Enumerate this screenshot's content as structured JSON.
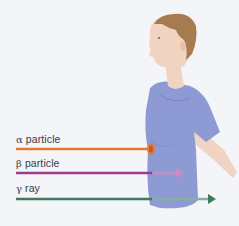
{
  "figure": {
    "title": ""
  },
  "beams": [
    {
      "symbol": "α",
      "name": "particle",
      "color": "#e8772f",
      "outcome": "stopped-at-skin"
    },
    {
      "symbol": "β",
      "name": "particle",
      "color": "#9b3d8c",
      "exit_color": "#c98dc4",
      "outcome": "penetrates-partially"
    },
    {
      "symbol": "γ",
      "name": "ray",
      "color": "#3f7a5c",
      "exit_color": "#86b09a",
      "outcome": "passes-through"
    }
  ],
  "colors": {
    "background": "#f4f5f9",
    "shirt": "#8e9ad4",
    "skin": "#f1d3c2",
    "hair": "#a67b4f"
  }
}
